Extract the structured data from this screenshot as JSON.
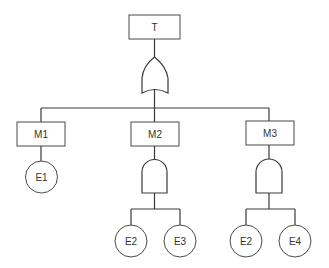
{
  "diagram": {
    "type": "fault-tree",
    "top_event": {
      "id": "T",
      "label": "T",
      "gate": "OR"
    },
    "intermediate_events": [
      {
        "id": "M1",
        "label": "M1",
        "gate": null,
        "children": [
          "E1"
        ]
      },
      {
        "id": "M2",
        "label": "M2",
        "gate": "AND",
        "children": [
          "E2",
          "E3"
        ]
      },
      {
        "id": "M3",
        "label": "M3",
        "gate": "AND",
        "children": [
          "E2",
          "E4"
        ]
      }
    ],
    "basic_events": [
      {
        "id": "E1",
        "label": "E1",
        "parent": "M1"
      },
      {
        "id": "E2a",
        "label": "E2",
        "parent": "M2"
      },
      {
        "id": "E3",
        "label": "E3",
        "parent": "M2"
      },
      {
        "id": "E2b",
        "label": "E2",
        "parent": "M3"
      },
      {
        "id": "E4",
        "label": "E4",
        "parent": "M3"
      }
    ],
    "colors": {
      "line": "#3a3a3a",
      "background": "#ffffff"
    }
  }
}
